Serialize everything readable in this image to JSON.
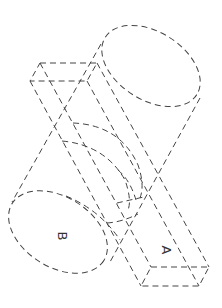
{
  "diagram": {
    "title": "",
    "stroke_color": "#444444",
    "background": "#ffffff",
    "labels": [
      {
        "id": "A",
        "text": "A",
        "target": "rectangular-prism",
        "x": 162,
        "y": 250,
        "rotation": 90
      },
      {
        "id": "B",
        "text": "B",
        "target": "cylinder-end",
        "x": 58,
        "y": 236,
        "rotation": 90
      }
    ],
    "shapes": {
      "cylinder": {
        "top_ellipse": {
          "cx": 151,
          "cy": 66,
          "rx": 54,
          "ry": 34,
          "rotate": 32
        },
        "bottom_ellipse": {
          "cx": 58,
          "cy": 232,
          "rx": 54,
          "ry": 35,
          "rotate": 32
        }
      },
      "prism": {
        "top_face": [
          [
            40,
            63
          ],
          [
            97,
            63
          ],
          [
            87,
            81
          ],
          [
            30,
            81
          ]
        ],
        "bottom_face": [
          [
            151,
            267
          ],
          [
            209,
            267
          ],
          [
            199,
            286
          ],
          [
            141,
            286
          ]
        ]
      }
    }
  }
}
